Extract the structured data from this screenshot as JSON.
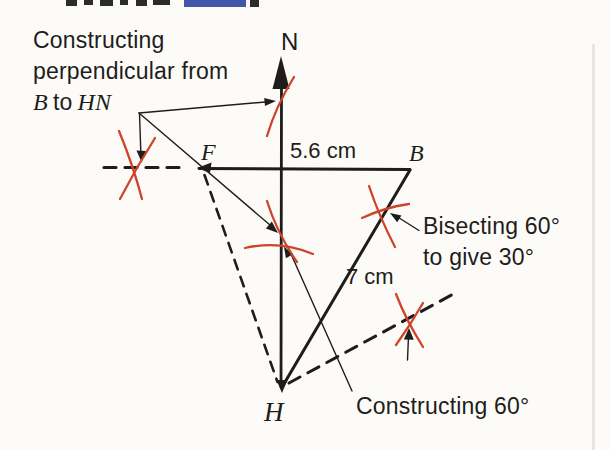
{
  "figure": {
    "kind": "compass-and-ruler construction diagram (scale drawing with bearings)",
    "colors": {
      "paper": "#fcfbf8",
      "ink": "#1e1d1b",
      "construction_marks": "#cf4429",
      "cropped_heading": "#4156a8"
    }
  },
  "points": {
    "north": "N",
    "f": "F",
    "b": "B",
    "h": "H"
  },
  "measurements": {
    "fb": "5.6 cm",
    "hb": "7 cm"
  },
  "annotations": {
    "perpendicular_line1": "Constructing",
    "perpendicular_line2": "perpendicular from",
    "perpendicular_b": "B",
    "perpendicular_to": "to",
    "perpendicular_hn": "HN",
    "bisecting_line1": "Bisecting 60°",
    "bisecting_line2": "to give 30°",
    "sixty": "Constructing 60°"
  }
}
